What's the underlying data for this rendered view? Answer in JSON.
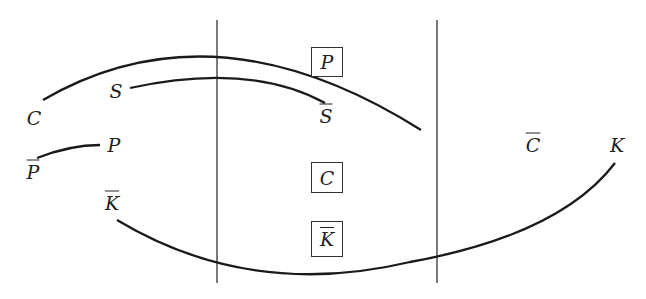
{
  "diagram": {
    "type": "pairing-arcs",
    "stroke_color": "#1a1a1a",
    "vertical_lines": [
      {
        "x": 217,
        "y1": 20,
        "y2": 283
      },
      {
        "x": 437,
        "y1": 20,
        "y2": 283
      }
    ],
    "labels": {
      "C": "C",
      "S": "S",
      "S_bar": "S",
      "P": "P",
      "P_bar": "P",
      "K": "K",
      "K_bar": "K",
      "C_bar": "C"
    },
    "boxes": [
      {
        "id": "P",
        "label": "P",
        "overline": false
      },
      {
        "id": "C",
        "label": "C",
        "overline": false
      },
      {
        "id": "K_bar",
        "label": "K",
        "overline": true
      }
    ],
    "arcs": [
      {
        "from": "C",
        "to": "C̄",
        "path": "M 43 100 Q 215 0 421 130"
      },
      {
        "from": "S",
        "to": "S̄",
        "path": "M 130 88 Q 250 62 325 103"
      },
      {
        "from": "P̄",
        "to": "P",
        "path": "M 37 158 Q 70 145 100 145"
      },
      {
        "from": "K̄",
        "to": "K",
        "path": "M 117 220 Q 250 300 410 262 Q 560 235 615 163"
      }
    ]
  }
}
